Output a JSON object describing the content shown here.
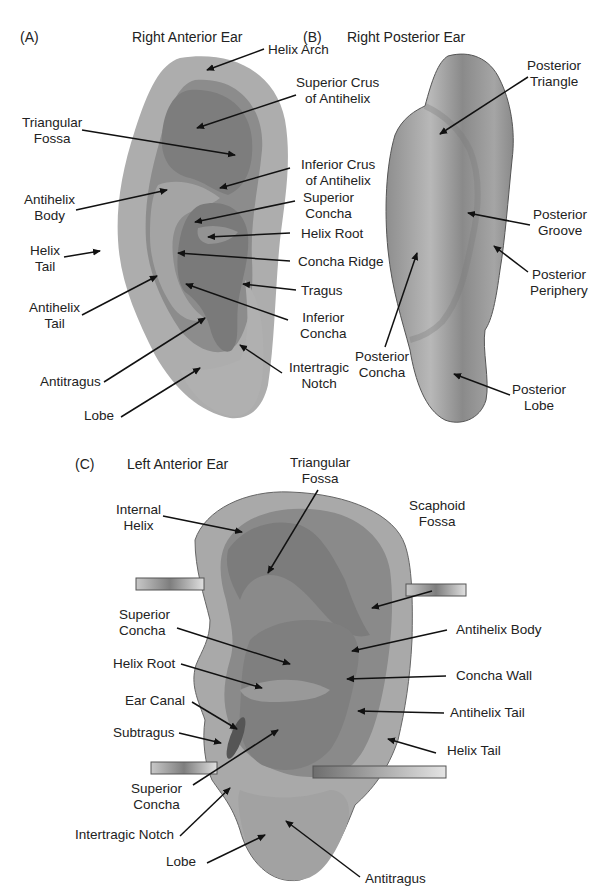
{
  "figure": {
    "panels": [
      {
        "tag": "(A)",
        "title": "Right Anterior Ear",
        "labels": [
          {
            "id": "helix-arch",
            "lines": [
              "Helix Arch"
            ]
          },
          {
            "id": "superior-crus-of-antihelix",
            "lines": [
              "Superior Crus",
              "of Antihelix"
            ]
          },
          {
            "id": "triangular-fossa",
            "lines": [
              "Triangular",
              "Fossa"
            ]
          },
          {
            "id": "inferior-crus-of-antihelix",
            "lines": [
              "Inferior Crus",
              "of Antihelix"
            ]
          },
          {
            "id": "antihelix-body",
            "lines": [
              "Antihelix",
              "Body"
            ]
          },
          {
            "id": "superior-concha",
            "lines": [
              "Superior",
              "Concha"
            ]
          },
          {
            "id": "helix-root",
            "lines": [
              "Helix Root"
            ]
          },
          {
            "id": "helix-tail",
            "lines": [
              "Helix",
              "Tail"
            ]
          },
          {
            "id": "concha-ridge",
            "lines": [
              "Concha Ridge"
            ]
          },
          {
            "id": "tragus",
            "lines": [
              "Tragus"
            ]
          },
          {
            "id": "antihelix-tail",
            "lines": [
              "Antihelix",
              "Tail"
            ]
          },
          {
            "id": "inferior-concha",
            "lines": [
              "Inferior",
              "Concha"
            ]
          },
          {
            "id": "intertragic-notch",
            "lines": [
              "Intertragic",
              "Notch"
            ]
          },
          {
            "id": "antitragus",
            "lines": [
              "Antitragus"
            ]
          },
          {
            "id": "lobe",
            "lines": [
              "Lobe"
            ]
          }
        ]
      },
      {
        "tag": "(B)",
        "title": "Right Posterior Ear",
        "labels": [
          {
            "id": "posterior-triangle",
            "lines": [
              "Posterior",
              "Triangle"
            ]
          },
          {
            "id": "posterior-groove",
            "lines": [
              "Posterior",
              "Groove"
            ]
          },
          {
            "id": "posterior-periphery",
            "lines": [
              "Posterior",
              "Periphery"
            ]
          },
          {
            "id": "posterior-concha",
            "lines": [
              "Posterior",
              "Concha"
            ]
          },
          {
            "id": "posterior-lobe",
            "lines": [
              "Posterior",
              "Lobe"
            ]
          }
        ]
      },
      {
        "tag": "(C)",
        "title": "Left Anterior Ear",
        "labels": [
          {
            "id": "triangular-fossa",
            "lines": [
              "Triangular",
              "Fossa"
            ]
          },
          {
            "id": "internal-helix",
            "lines": [
              "Internal",
              "Helix"
            ]
          },
          {
            "id": "scaphoid-fossa",
            "lines": [
              "Scaphoid",
              "Fossa"
            ]
          },
          {
            "id": "superior-concha-upper",
            "lines": [
              "Superior",
              "Concha"
            ]
          },
          {
            "id": "antihelix-body",
            "lines": [
              "Antihelix Body"
            ]
          },
          {
            "id": "helix-root",
            "lines": [
              "Helix Root"
            ]
          },
          {
            "id": "concha-wall",
            "lines": [
              "Concha Wall"
            ]
          },
          {
            "id": "ear-canal",
            "lines": [
              "Ear Canal"
            ]
          },
          {
            "id": "antihelix-tail",
            "lines": [
              "Antihelix Tail"
            ]
          },
          {
            "id": "subtragus",
            "lines": [
              "Subtragus"
            ]
          },
          {
            "id": "helix-tail",
            "lines": [
              "Helix Tail"
            ]
          },
          {
            "id": "superior-concha-lower",
            "lines": [
              "Superior",
              "Concha"
            ]
          },
          {
            "id": "intertragic-notch",
            "lines": [
              "Intertragic Notch"
            ]
          },
          {
            "id": "lobe",
            "lines": [
              "Lobe"
            ]
          },
          {
            "id": "antitragus",
            "lines": [
              "Antitragus"
            ]
          }
        ]
      }
    ],
    "colors": {
      "background": "#ffffff",
      "ear_light": "#b4b4b4",
      "ear_mid": "#9a9a9a",
      "ear_dark": "#7a7a7a",
      "ear_outline": "#555555",
      "text": "#222222",
      "arrow": "#111111"
    }
  }
}
